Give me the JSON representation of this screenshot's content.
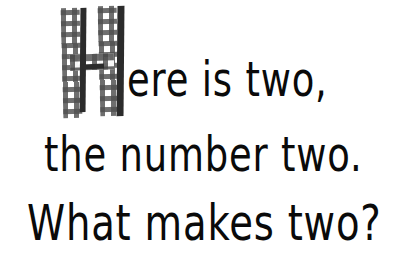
{
  "page": {
    "background_color": "#ffffff",
    "text_color": "#0a0a0a",
    "width": 396,
    "height": 277
  },
  "dropcap": {
    "letter": "H",
    "style": "gingham-check",
    "check_color": "#464646",
    "shadow_color": "#2b2b2b"
  },
  "lines": [
    {
      "text": "ere is two,"
    },
    {
      "text": "the number two."
    },
    {
      "text": "What makes two?"
    }
  ],
  "full_text": "Here is two, the number two. What makes two?"
}
